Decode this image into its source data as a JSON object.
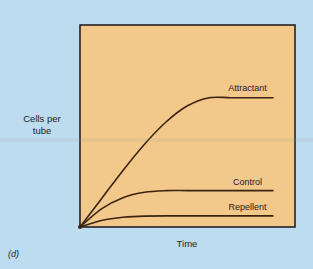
{
  "panel_label": "(d)",
  "colors": {
    "background": "#bedcf0",
    "plot_fill": "#f2c98a",
    "line": "#3a2410",
    "frame": "#222222"
  },
  "chart_data": {
    "type": "line",
    "title": "",
    "xlabel": "Time",
    "ylabel": "Cells per tube",
    "xlim": [
      0,
      10
    ],
    "ylim": [
      0,
      10
    ],
    "grid": false,
    "legend": "inline-labels",
    "series": [
      {
        "name": "Attractant",
        "x": [
          0,
          1,
          2,
          3,
          4,
          5,
          6,
          7,
          8,
          9
        ],
        "y": [
          0,
          1.4,
          2.8,
          4.1,
          5.2,
          6.0,
          6.4,
          6.4,
          6.4,
          6.4
        ]
      },
      {
        "name": "Control",
        "x": [
          0,
          1,
          2,
          3,
          4,
          5,
          6,
          7,
          8,
          9
        ],
        "y": [
          0,
          0.9,
          1.45,
          1.72,
          1.8,
          1.8,
          1.8,
          1.8,
          1.8,
          1.8
        ]
      },
      {
        "name": "Repellent",
        "x": [
          0,
          1,
          2,
          3,
          4,
          5,
          6,
          7,
          8,
          9
        ],
        "y": [
          0,
          0.32,
          0.48,
          0.54,
          0.55,
          0.55,
          0.55,
          0.55,
          0.55,
          0.55
        ]
      }
    ]
  }
}
